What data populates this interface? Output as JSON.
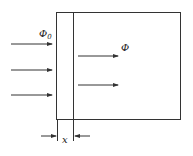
{
  "diagram": {
    "labels": {
      "incident_flux": "Φ",
      "incident_flux_subscript": "0",
      "transmitted_flux": "Φ",
      "thickness": "x"
    },
    "colors": {
      "line": "#333333",
      "background": "#ffffff"
    },
    "incident_arrows": 3,
    "transmitted_arrows": 2
  }
}
